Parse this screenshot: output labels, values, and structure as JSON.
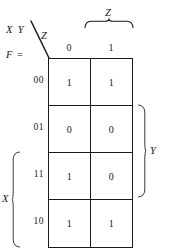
{
  "figure": {
    "type": "karnaugh-map",
    "function_label": "F =",
    "corner": {
      "row_vars": "X Y",
      "col_var": "Z"
    },
    "column_group": {
      "label": "Z",
      "covers": [
        "1"
      ]
    },
    "row_groups": [
      {
        "label": "Y",
        "side": "right",
        "covers": [
          "01",
          "11"
        ]
      },
      {
        "label": "X",
        "side": "left",
        "covers": [
          "11",
          "10"
        ]
      }
    ],
    "columns": [
      {
        "header": "0"
      },
      {
        "header": "1"
      }
    ],
    "rows": [
      {
        "header": "00",
        "cells": [
          "1",
          "1"
        ]
      },
      {
        "header": "01",
        "cells": [
          "0",
          "0"
        ]
      },
      {
        "header": "11",
        "cells": [
          "1",
          "0"
        ]
      },
      {
        "header": "10",
        "cells": [
          "1",
          "1"
        ]
      }
    ],
    "colors": {
      "line": "#1a1a1a",
      "text": "#141414",
      "background": "#ffffff"
    }
  }
}
